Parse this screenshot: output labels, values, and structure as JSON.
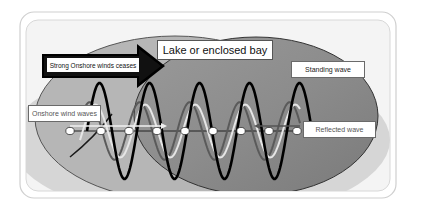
{
  "diagram": {
    "title_label": "Lake or enclosed bay",
    "arrow_label": "Strong Onshore winds ceases",
    "labels": {
      "standing_wave": "Standing wave",
      "onshore_wind_waves": "Onshore wind waves",
      "reflected_wave": "Reflected wave"
    },
    "node_count": 9,
    "wave_cycles": 4.5,
    "series": [
      {
        "name": "Standing wave",
        "color": "#000000",
        "relative_amplitude": 1.0
      },
      {
        "name": "Onshore wind waves",
        "color": "#e6e6e6",
        "relative_amplitude": 0.55
      },
      {
        "name": "Reflected wave",
        "color": "#5a5a5a",
        "relative_amplitude": 0.6
      }
    ],
    "colors": {
      "frame_border": "#c8c8c8",
      "frame_fill": "#f7f7f7",
      "outer_region": "#c4c4c4",
      "lake_dark": "#8a8a8a",
      "lake_light": "#a8a8a8",
      "arrow": "#000000",
      "node_fill": "#ffffff"
    }
  }
}
